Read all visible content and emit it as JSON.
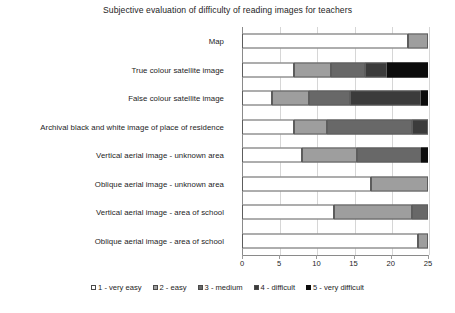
{
  "chart_data": {
    "type": "bar",
    "orientation": "horizontal",
    "stacked": true,
    "title": "Subjective evaluation of difficulty of reading images for teachers",
    "xlabel": "",
    "ylabel": "",
    "xlim": [
      0,
      25
    ],
    "xticks": [
      0,
      5,
      10,
      15,
      20,
      25
    ],
    "xtick_labels": [
      "0",
      "5",
      "10",
      "15",
      "20",
      "25"
    ],
    "grid": "vertical",
    "legend_position": "bottom",
    "categories": [
      "Map",
      "True colour satellite image",
      "False colour satellite image",
      "Archival black and white image of place of residence",
      "Vertical aerial image - unknown area",
      "Oblique aerial image - unknown area",
      "Vertical aerial image - area of school",
      "Oblique aerial image - area of school"
    ],
    "series": [
      {
        "name": "1 - very easy",
        "color": "#ffffff",
        "values": [
          22.3,
          7.0,
          4.0,
          7.0,
          8.0,
          17.3,
          12.4,
          23.6
        ]
      },
      {
        "name": "2 - easy",
        "color": "#9e9e9e",
        "values": [
          2.7,
          5.0,
          5.0,
          4.4,
          7.5,
          7.7,
          10.4,
          1.4
        ]
      },
      {
        "name": "3 - medium",
        "color": "#686868",
        "values": [
          0,
          4.5,
          5.5,
          11.4,
          8.5,
          0,
          2.2,
          0
        ]
      },
      {
        "name": "4 - difficult",
        "color": "#3b3b3b",
        "values": [
          0,
          3.0,
          9.5,
          2.2,
          0,
          0,
          0,
          0
        ]
      },
      {
        "name": "5 - very difficult",
        "color": "#0c0c0c",
        "values": [
          0,
          5.5,
          1.0,
          0,
          1.0,
          0,
          0,
          0
        ]
      }
    ],
    "totals": [
      25,
      25,
      25,
      25,
      25,
      25,
      25,
      25
    ]
  }
}
